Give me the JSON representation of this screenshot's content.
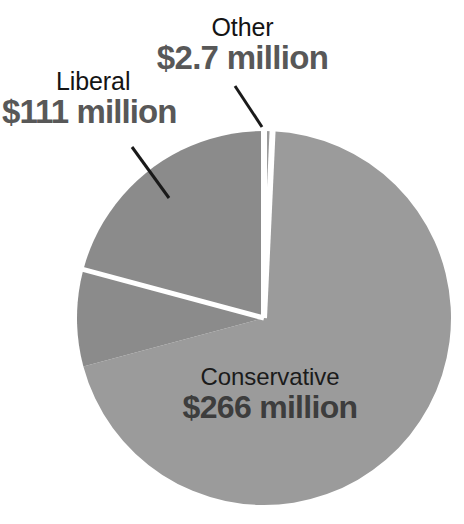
{
  "chart_data": {
    "type": "pie",
    "title": "",
    "subtitle": "",
    "xlabel": "",
    "ylabel": "",
    "units": "million",
    "currency": "$",
    "legend_position": "none",
    "grid": false,
    "categories": [
      "Conservative",
      "Liberal",
      "Other"
    ],
    "values": [
      266,
      111,
      2.7
    ],
    "value_labels": [
      "$266 million",
      "$111 million",
      "$2.7 million"
    ],
    "total": 379.7,
    "slices": [
      {
        "name": "Conservative",
        "label": "Conservative",
        "value": 266,
        "value_label": "$266 million",
        "percent": 70.1,
        "color": "#9b9b9b",
        "start_angle_deg": 2.6,
        "end_angle_deg": 255.0,
        "sweep_deg": 252.4,
        "label_placement": "inside"
      },
      {
        "name": "Liberal",
        "label": "Liberal",
        "value": 111,
        "value_label": "$111 million",
        "percent": 29.2,
        "color": "#8b8b8b",
        "start_angle_deg": 255.0,
        "end_angle_deg": 360.0,
        "sweep_deg": 105.0,
        "label_placement": "outside",
        "leader_line": true
      },
      {
        "name": "Other",
        "label": "Other",
        "value": 2.7,
        "value_label": "$2.7 million",
        "percent": 0.7,
        "color": "#9b9b9b",
        "start_angle_deg": 0.0,
        "end_angle_deg": 2.6,
        "sweep_deg": 2.6,
        "label_placement": "outside",
        "leader_line": true
      }
    ],
    "geometry": {
      "center_x": 264,
      "center_y": 318,
      "radius": 187,
      "start_angle_deg": 0,
      "direction": "clockwise",
      "separator_color": "#ffffff",
      "separator_width": 5
    },
    "colors": {
      "background": "#ffffff",
      "liberal_slice": "#8b8b8b",
      "conservative_slice": "#9b9b9b",
      "other_slice": "#9b9b9b",
      "separator": "#ffffff",
      "category_text": "#141414",
      "amount_text": "#585858",
      "inside_amount_text": "#3d3d3d",
      "leader_line": "#1a1a1a"
    }
  },
  "labels": {
    "other": {
      "category": "Other",
      "amount": "$2.7 million"
    },
    "liberal": {
      "category": "Liberal",
      "amount": "$111 million"
    },
    "conservative": {
      "category": "Conservative",
      "amount": "$266 million"
    }
  }
}
